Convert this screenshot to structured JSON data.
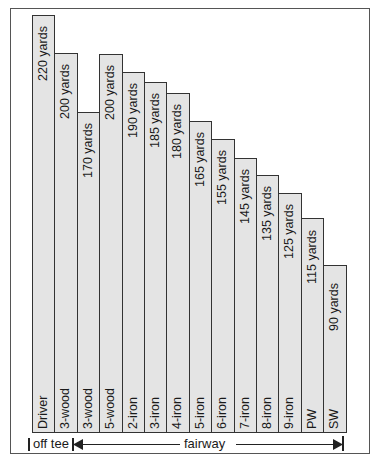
{
  "chart_data": {
    "type": "bar",
    "title": "",
    "xlabel": "",
    "ylabel": "",
    "categories": [
      "Driver",
      "3-wood",
      "3-wood",
      "5-wood",
      "2-iron",
      "3-iron",
      "4-iron",
      "5-iron",
      "6-iron",
      "7-iron",
      "8-iron",
      "9-iron",
      "PW",
      "SW"
    ],
    "values": [
      220,
      200,
      170,
      200,
      190,
      185,
      180,
      165,
      155,
      145,
      135,
      125,
      115,
      90
    ],
    "value_labels": [
      "220 yards",
      "200 yards",
      "170 yards",
      "200 yards",
      "190 yards",
      "185 yards",
      "180 yards",
      "165 yards",
      "155 yards",
      "145 yards",
      "135 yards",
      "125 yards",
      "115 yards",
      "90 yards"
    ],
    "unit": "yards",
    "groups": [
      {
        "label": "off tee",
        "categories": [
          "Driver"
        ]
      },
      {
        "label": "fairway",
        "categories": [
          "3-wood",
          "3-wood",
          "5-wood",
          "2-iron",
          "3-iron",
          "4-iron",
          "5-iron",
          "6-iron",
          "7-iron",
          "8-iron",
          "9-iron",
          "PW",
          "SW"
        ]
      }
    ],
    "grid": false,
    "legend": "none"
  },
  "bars": [
    {
      "club": "Driver",
      "label": "220 yards",
      "top": 15
    },
    {
      "club": "3-wood",
      "label": "200 yards",
      "top": 53
    },
    {
      "club": "3-wood",
      "label": "170 yards",
      "top": 112
    },
    {
      "club": "5-wood",
      "label": "200 yards",
      "top": 54
    },
    {
      "club": "2-iron",
      "label": "190 yards",
      "top": 72
    },
    {
      "club": "3-iron",
      "label": "185 yards",
      "top": 82
    },
    {
      "club": "4-iron",
      "label": "180 yards",
      "top": 93
    },
    {
      "club": "5-iron",
      "label": "165 yards",
      "top": 121
    },
    {
      "club": "6-iron",
      "label": "155 yards",
      "top": 139
    },
    {
      "club": "7-iron",
      "label": "145 yards",
      "top": 158
    },
    {
      "club": "8-iron",
      "label": "135 yards",
      "top": 175
    },
    {
      "club": "9-iron",
      "label": "125 yards",
      "top": 193
    },
    {
      "club": "PW",
      "label": "115 yards",
      "top": 218
    },
    {
      "club": "SW",
      "label": "90 yards",
      "top": 265
    }
  ],
  "footer": {
    "off_tee_label": "off tee",
    "fairway_label": "fairway"
  },
  "colors": {
    "bar_fill": "#e4e4e4",
    "bar_border": "#333333",
    "frame": "#555555"
  }
}
